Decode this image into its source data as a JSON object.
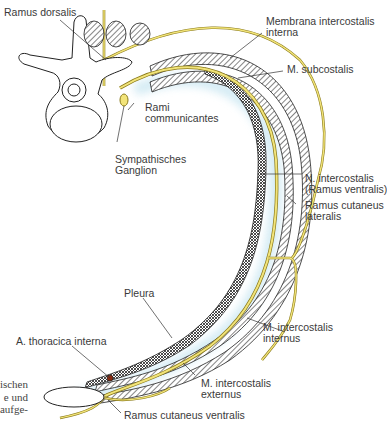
{
  "diagram": {
    "type": "anatomical cross-section",
    "colors": {
      "nerve": "#e8d96a",
      "nerve_outline": "#8a7a1a",
      "pleura_glow": "#d6eef6",
      "outline": "#222222",
      "label": "#3a3a3a",
      "artery": "#8a2a10"
    },
    "labels": [
      {
        "id": "ramus-dorsalis",
        "text": "Ramus dorsalis"
      },
      {
        "id": "membrana-intercostalis-interna",
        "text": "Membrana intercostalis\ninterna"
      },
      {
        "id": "m-subcostalis",
        "text": "M. subcostalis"
      },
      {
        "id": "rami-communicantes",
        "text": "Rami\ncommunicantes"
      },
      {
        "id": "sympathisches-ganglion",
        "text": "Sympathisches\nGanglion"
      },
      {
        "id": "n-intercostalis",
        "text": "N. intercostalis\n(Ramus ventralis)"
      },
      {
        "id": "ramus-cutaneus-lateralis",
        "text": "Ramus cutaneus\nlateralis"
      },
      {
        "id": "pleura",
        "text": "Pleura"
      },
      {
        "id": "m-intercostalis-internus",
        "text": "M. intercostalis\ninternus"
      },
      {
        "id": "a-thoracica-interna",
        "text": "A. thoracica interna"
      },
      {
        "id": "m-intercostalis-externus",
        "text": "M. intercostalis\nexternus"
      },
      {
        "id": "ramus-cutaneus-ventralis",
        "text": "Ramus cutaneus ventralis"
      }
    ],
    "margin_text": "ischen\ne und\naufge-"
  }
}
